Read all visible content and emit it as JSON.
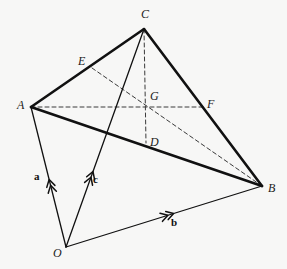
{
  "figure": {
    "kind": "geometry-diagram",
    "width": 287,
    "height": 269,
    "background_color": "#f7f7f6",
    "solid_stroke_color": "#111111",
    "dashed_stroke_color": "#3a3a3a"
  },
  "points": {
    "A": {
      "label": "A",
      "x": 31,
      "y": 107,
      "label_x": 17,
      "label_y": 99
    },
    "B": {
      "label": "B",
      "x": 262,
      "y": 186,
      "label_x": 268,
      "label_y": 182
    },
    "C": {
      "label": "C",
      "x": 144,
      "y": 29,
      "label_x": 141,
      "label_y": 8
    },
    "O": {
      "label": "O",
      "x": 66,
      "y": 247,
      "label_x": 53,
      "label_y": 247
    },
    "D": {
      "label": "D",
      "x": 146,
      "y": 143,
      "label_x": 150,
      "label_y": 136
    },
    "E": {
      "label": "E",
      "x": 92,
      "y": 68,
      "label_x": 78,
      "label_y": 55
    },
    "F": {
      "label": "F",
      "x": 203,
      "y": 107,
      "label_x": 207,
      "label_y": 98
    },
    "G": {
      "label": "G",
      "x": 146,
      "y": 107,
      "label_x": 150,
      "label_y": 90
    }
  },
  "edges_solid": [
    {
      "name": "edge-A-C",
      "from": "A",
      "to": "C",
      "width": 2.6
    },
    {
      "name": "edge-C-B",
      "from": "C",
      "to": "B",
      "width": 2.6
    },
    {
      "name": "edge-A-B",
      "from": "A",
      "to": "B",
      "width": 2.6
    },
    {
      "name": "edge-O-A",
      "from": "O",
      "to": "A",
      "width": 1.3
    },
    {
      "name": "edge-O-B",
      "from": "O",
      "to": "B",
      "width": 1.3
    },
    {
      "name": "edge-O-C",
      "from": "O",
      "to": "C",
      "width": 1.3
    }
  ],
  "edges_dashed": [
    {
      "name": "median-A-F",
      "from": "A",
      "to": "F",
      "width": 1.0
    },
    {
      "name": "median-C-D",
      "from": "C",
      "to": "D",
      "width": 1.0
    },
    {
      "name": "median-E-B",
      "from": "E",
      "to": "B",
      "width": 1.0
    }
  ],
  "vectors": [
    {
      "name": "vector-a",
      "label": "a",
      "from": "O",
      "to": "A",
      "ticks": 2,
      "tick_pos": 0.44,
      "label_x": 34,
      "label_y": 171
    },
    {
      "name": "vector-c",
      "label": "c",
      "from": "O",
      "to": "C",
      "ticks": 2,
      "tick_pos": 0.32,
      "label_x": 93,
      "label_y": 174
    },
    {
      "name": "vector-b",
      "label": "b",
      "from": "O",
      "to": "B",
      "ticks": 2,
      "tick_pos": 0.52,
      "label_x": 171,
      "label_y": 217
    }
  ]
}
